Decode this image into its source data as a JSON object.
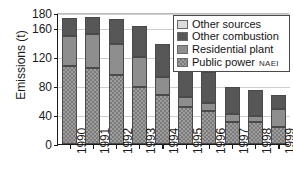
{
  "chart_data": {
    "type": "bar",
    "stacked": true,
    "title": "",
    "subtitle": "",
    "xlabel": "",
    "ylabel": "Emissions (t)",
    "categories": [
      "1990",
      "1991",
      "1992",
      "1993",
      "1994",
      "1995",
      "1996",
      "1997",
      "1998",
      "1999"
    ],
    "series": [
      {
        "name": "Public power",
        "values": [
          107,
          104,
          95,
          79,
          68,
          51,
          46,
          30,
          30,
          23
        ],
        "color": "#9d9d9d",
        "pattern": "checkered"
      },
      {
        "name": "Residential plant",
        "values": [
          41,
          47,
          42,
          40,
          24,
          13,
          11,
          11,
          8,
          25
        ],
        "color": "#8e8e8e",
        "pattern": "solid"
      },
      {
        "name": "Other combustion",
        "values": [
          25,
          24,
          35,
          43,
          46,
          44,
          42,
          38,
          36,
          20
        ],
        "color": "#575757",
        "pattern": "solid"
      },
      {
        "name": "Other sources",
        "values": [
          0,
          0,
          0,
          0,
          0,
          0,
          0,
          0,
          0,
          0
        ],
        "color": "#dcdcdc",
        "pattern": "solid"
      }
    ],
    "totals": [
      173,
      175,
      172,
      162,
      138,
      108,
      99,
      79,
      74,
      68
    ],
    "ylim": [
      0,
      180
    ],
    "yticks": [
      0,
      40,
      80,
      120,
      160,
      180
    ],
    "ytick_labels": [
      "0",
      "40",
      "80",
      "120",
      "160",
      "180"
    ],
    "grid": true,
    "grid_axis": "y",
    "legend_position": "top-right",
    "legend_entries": [
      "Other sources",
      "Other combustion",
      "Residential plant",
      "Public power"
    ],
    "annotations": [
      "NAEI"
    ]
  },
  "legend": {
    "items": [
      {
        "label": "Other sources"
      },
      {
        "label": "Other combustion"
      },
      {
        "label": "Residential plant"
      },
      {
        "label": "Public power"
      }
    ]
  },
  "watermark": {
    "text": "NAEI"
  }
}
